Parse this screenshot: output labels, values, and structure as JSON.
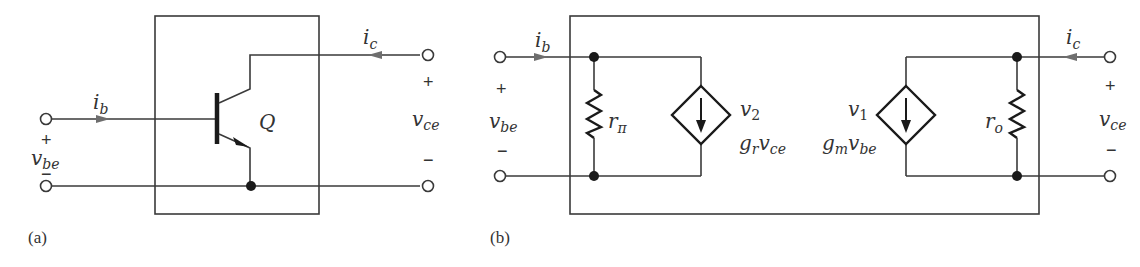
{
  "diagram_a": {
    "figure_label": "(a)",
    "transistor_label": "Q",
    "base_current": {
      "symbol": "i",
      "subscript": "b"
    },
    "collector_current": {
      "symbol": "i",
      "subscript": "c"
    },
    "input_voltage": {
      "symbol": "v",
      "subscript": "be",
      "plus": "+",
      "minus": "−"
    },
    "output_voltage": {
      "symbol": "v",
      "subscript": "ce",
      "plus": "+",
      "minus": "−"
    }
  },
  "diagram_b": {
    "figure_label": "(b)",
    "base_current": {
      "symbol": "i",
      "subscript": "b"
    },
    "collector_current": {
      "symbol": "i",
      "subscript": "c"
    },
    "input_voltage": {
      "symbol": "v",
      "subscript": "be",
      "plus": "+",
      "minus": "−"
    },
    "output_voltage": {
      "symbol": "v",
      "subscript": "ce",
      "plus": "+",
      "minus": "−"
    },
    "input_resistor": {
      "symbol": "r",
      "subscript": "π"
    },
    "output_resistor": {
      "symbol": "r",
      "subscript": "o"
    },
    "source_2": {
      "name": "v",
      "name_sub": "2",
      "expr_g": "g",
      "expr_g_sub": "r",
      "expr_v": "v",
      "expr_v_sub": "ce"
    },
    "source_1": {
      "name": "v",
      "name_sub": "1",
      "expr_g": "g",
      "expr_g_sub": "m",
      "expr_v": "v",
      "expr_v_sub": "be"
    }
  }
}
